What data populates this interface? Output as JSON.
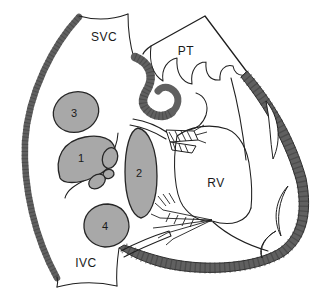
{
  "diagram": {
    "vessel_labels": {
      "svc": "SVC",
      "pt": "PT",
      "rv": "RV",
      "ivc": "IVC"
    },
    "numbered_sites": [
      "1",
      "2",
      "3",
      "4"
    ],
    "colors": {
      "background": "#ffffff",
      "outline": "#1f1f1f",
      "muscle_wall": "#606060",
      "wall_texture": "#3d3d3d",
      "site_fill": "#a8a8a8",
      "site_stroke": "#262626",
      "text": "#1a1a1a"
    }
  }
}
